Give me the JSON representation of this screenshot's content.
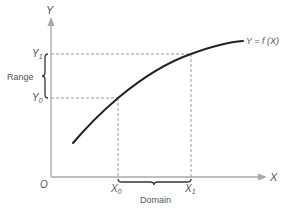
{
  "diagram": {
    "colors": {
      "background": "#ffffff",
      "axis": "#a8a8a8",
      "guides": "#9a9a9a",
      "curve": "#222222",
      "text": "#555555"
    },
    "axes": {
      "x_label": "X",
      "y_label": "Y",
      "origin_label": "O"
    },
    "curve": {
      "label": "Y = f (X)",
      "description": "increasing concave curve"
    },
    "points": {
      "x0_label": "X",
      "x0_sub": "0",
      "x1_label": "X",
      "x1_sub": "1",
      "y0_label": "Y",
      "y0_sub": "0",
      "y1_label": "Y",
      "y1_sub": "1"
    },
    "braces": {
      "domain_label": "Domain",
      "range_label": "Range"
    }
  }
}
